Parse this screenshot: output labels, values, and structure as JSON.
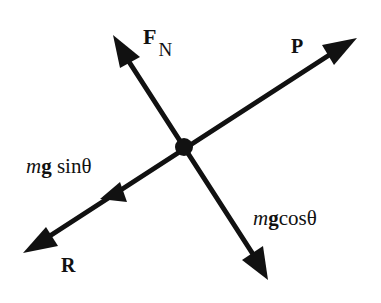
{
  "diagram": {
    "colors": {
      "ink": "#111111",
      "background": "#ffffff"
    },
    "center": {
      "x": 184,
      "y": 147
    },
    "vectors": [
      {
        "id": "normal-force",
        "label": "F",
        "subscript": "N",
        "tip": {
          "x": 113,
          "y": 35
        }
      },
      {
        "id": "applied-force",
        "label": "P",
        "tip": {
          "x": 357,
          "y": 38
        }
      },
      {
        "id": "resistance-force",
        "label": "R",
        "tip": {
          "x": 23,
          "y": 253
        }
      },
      {
        "id": "weight-perpendicular",
        "label_italic": "m",
        "label_bold": "g",
        "label_rest": "cosθ",
        "tip": {
          "x": 268,
          "y": 280
        }
      },
      {
        "id": "weight-parallel",
        "label_italic": "m",
        "label_bold": "g",
        "label_rest": " sinθ",
        "tip": {
          "x": 100,
          "y": 197
        }
      }
    ],
    "labels": {
      "fn_main": "F",
      "fn_sub": "N",
      "p": "P",
      "r": "R",
      "sin_m": "m",
      "sin_g": "g",
      "sin_rest": " sinθ",
      "cos_m": "m",
      "cos_g": "g",
      "cos_rest": "cosθ"
    }
  }
}
